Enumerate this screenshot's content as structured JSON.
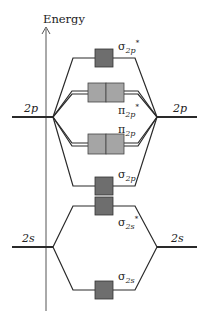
{
  "diagram": {
    "axis_label": "Energy",
    "colors": {
      "sigma_box": "#6e6e6e",
      "pi_box": "#a5a5a5",
      "line": "#2a2a2a"
    },
    "atomic_orbitals": {
      "left_2p": {
        "main": "2",
        "sub": "p"
      },
      "right_2p": {
        "main": "2",
        "sub": "p"
      },
      "left_2s": {
        "main": "2",
        "sub": "s"
      },
      "right_2s": {
        "main": "2",
        "sub": "s"
      }
    },
    "molecular_orbitals": [
      {
        "id": "sigma_2p_star",
        "symbol": "σ",
        "sub": "2p",
        "sup": "*",
        "type": "sigma"
      },
      {
        "id": "pi_2p_star",
        "symbol": "π",
        "sub": "2p",
        "sup": "*",
        "type": "pi"
      },
      {
        "id": "pi_2p",
        "symbol": "π",
        "sub": "2p",
        "sup": "",
        "type": "pi"
      },
      {
        "id": "sigma_2p",
        "symbol": "σ",
        "sub": "2p",
        "sup": "",
        "type": "sigma"
      },
      {
        "id": "sigma_2s_star",
        "symbol": "σ",
        "sub": "2s",
        "sup": "*",
        "type": "sigma"
      },
      {
        "id": "sigma_2s",
        "symbol": "σ",
        "sub": "2s",
        "sup": "",
        "type": "sigma"
      }
    ]
  }
}
